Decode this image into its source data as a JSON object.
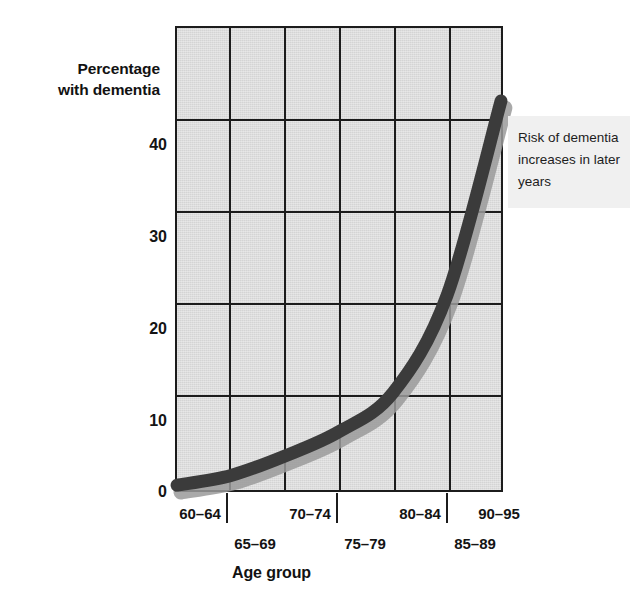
{
  "chart_data": {
    "type": "line",
    "title": "",
    "xlabel": "Age group",
    "ylabel": "Percentage with dementia",
    "ylabel_lines": [
      "Percentage",
      "with dementia"
    ],
    "categories": [
      "60–64",
      "65–69",
      "70–74",
      "75–79",
      "80–84",
      "85–89",
      "90–95"
    ],
    "values": [
      0.5,
      1.5,
      3.5,
      6,
      10,
      20,
      40
    ],
    "series": [
      {
        "name": "Percentage with dementia",
        "values": [
          0.5,
          1.5,
          3.5,
          6,
          10,
          20,
          40
        ]
      }
    ],
    "y_ticks": [
      0,
      10,
      20,
      30,
      40
    ],
    "ylim": [
      0,
      47.5
    ],
    "xlim_categories": 7,
    "grid": "both",
    "legend": "none",
    "annotations": [
      {
        "name": "risk-callout",
        "lines": [
          "Risk of dementia",
          "increases in later",
          "years"
        ],
        "text": "Risk of dementia increases in later years"
      }
    ],
    "colors": {
      "plot_background": "#d4d4d4",
      "axis": "#1c1c1c",
      "series_line": "#3b3b3b",
      "series_shadow": "#9a9a9a",
      "annotation_background": "#f0f0f0",
      "text": "#141414"
    }
  }
}
